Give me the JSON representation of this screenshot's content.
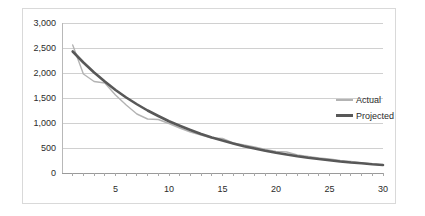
{
  "chart_data": {
    "type": "line",
    "title": "",
    "subtitle": "",
    "xlabel": "",
    "ylabel": "",
    "xlim": [
      0,
      30
    ],
    "ylim": [
      0,
      3000
    ],
    "grid": true,
    "legend_position": "right",
    "y_ticks": [
      "0",
      "500",
      "1,000",
      "1,500",
      "2,000",
      "2,500",
      "3,000"
    ],
    "y_tick_values": [
      0,
      500,
      1000,
      1500,
      2000,
      2500,
      3000
    ],
    "x_ticks": [
      "5",
      "10",
      "15",
      "20",
      "25",
      "30"
    ],
    "x_tick_values": [
      5,
      10,
      15,
      20,
      25,
      30
    ],
    "x": [
      1,
      2,
      3,
      4,
      5,
      6,
      7,
      8,
      9,
      10,
      11,
      12,
      13,
      14,
      15,
      16,
      17,
      18,
      19,
      20,
      21,
      22,
      23,
      24,
      25,
      26,
      27,
      28,
      29,
      30
    ],
    "series": [
      {
        "name": "Actual",
        "color": "#b3b3b3",
        "width": 1.4,
        "values": [
          2560,
          1980,
          1830,
          1800,
          1560,
          1360,
          1180,
          1080,
          1070,
          990,
          900,
          820,
          760,
          700,
          690,
          600,
          560,
          520,
          470,
          430,
          420,
          360,
          330,
          300,
          280,
          250,
          230,
          200,
          180,
          160
        ]
      },
      {
        "name": "Projected",
        "color": "#585858",
        "width": 2.6,
        "values": [
          2430,
          2210,
          2010,
          1830,
          1660,
          1510,
          1375,
          1250,
          1140,
          1035,
          945,
          860,
          780,
          710,
          650,
          590,
          535,
          490,
          445,
          405,
          370,
          335,
          305,
          280,
          255,
          230,
          210,
          195,
          175,
          160
        ]
      }
    ]
  },
  "legend": {
    "items": [
      {
        "label": "Actual"
      },
      {
        "label": "Projected"
      }
    ]
  }
}
